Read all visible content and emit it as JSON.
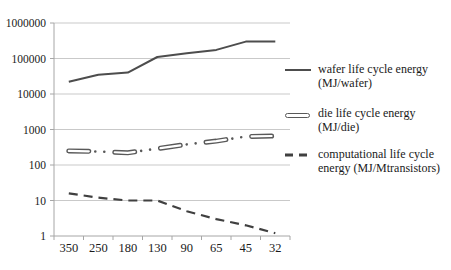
{
  "chart_data": {
    "type": "line",
    "title": "",
    "x_categories": [
      "350",
      "250",
      "180",
      "130",
      "90",
      "65",
      "45",
      "32"
    ],
    "y_axis": {
      "scale": "log",
      "min": 1,
      "max": 1000000,
      "tick_labels": [
        "1000000",
        "100000",
        "10000",
        "1000",
        "100",
        "10",
        "1"
      ]
    },
    "grid": "horizontal-major-on",
    "legend_position": "right",
    "series": [
      {
        "name": "wafer life cycle energy (MJ/wafer)",
        "legend_line1": "wafer life cycle energy",
        "legend_line2": "(MJ/wafer)",
        "style": "solid",
        "color": "#4d4d4d",
        "values": [
          22000,
          35000,
          40000,
          110000,
          140000,
          175000,
          300000,
          300000
        ]
      },
      {
        "name": "die life cycle energy (MJ/die)",
        "legend_line1": "die life cycle energy",
        "legend_line2": "(MJ/die)",
        "style": "thick-hollow-dash-dot-dot",
        "color": "#595959",
        "values": [
          250,
          240,
          220,
          290,
          380,
          470,
          630,
          660
        ]
      },
      {
        "name": "computational life cycle energy (MJ/Mtransistors)",
        "legend_line1": "computational life cycle",
        "legend_line2": "energy (MJ/Mtransistors)",
        "style": "dashed",
        "color": "#404040",
        "values": [
          16,
          12,
          10,
          10,
          5,
          3,
          2,
          1.2
        ]
      }
    ],
    "colors": {
      "gridline": "#c9c9c9",
      "axis": "#a6a6a6",
      "text": "#1a1a1a",
      "background": "#ffffff"
    }
  }
}
